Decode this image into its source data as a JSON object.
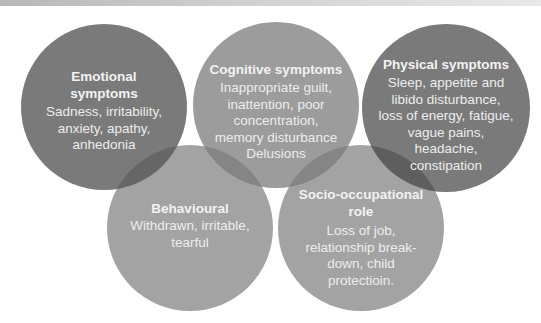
{
  "diagram": {
    "circles": [
      {
        "id": "emotional",
        "title": "Emotional\nsymptoms",
        "body": "Sadness, irritability,\nanxiety, apathy,\nanhedonia",
        "fill": "#6f6f6f"
      },
      {
        "id": "cognitive",
        "title": "Cognitive symptoms",
        "body": "Inappropriate guilt,\ninattention, poor\nconcentration,\nmemory disturbance\nDelusions",
        "fill": "#8e8e8e"
      },
      {
        "id": "physical",
        "title": "Physical symptoms",
        "body": "Sleep, appetite and\nlibido disturbance,\nloss of energy, fatigue,\nvague pains,\nheadache,\nconstipation",
        "fill": "#6f6f6f"
      },
      {
        "id": "behavioural",
        "title": "Behavioural",
        "body": "Withdrawn, irritable,\ntearful",
        "fill": "#9a9a9a"
      },
      {
        "id": "socio-occupational",
        "title": "Socio-occupational\nrole",
        "body": "Loss of job,\nrelationship break-\ndown, child\nprotectioin.",
        "fill": "#9a9a9a"
      }
    ]
  }
}
